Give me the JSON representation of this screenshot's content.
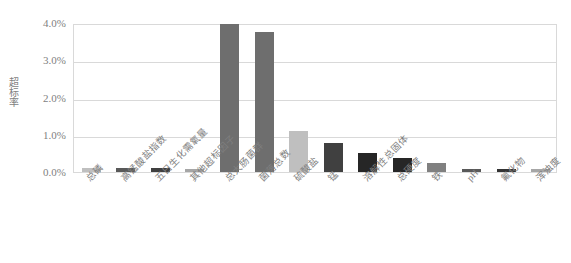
{
  "chart_data": {
    "type": "bar",
    "title": "",
    "subtitle": "",
    "xlabel": "",
    "ylabel": "超标率",
    "ylim": [
      0,
      4.0
    ],
    "y_unit": "%",
    "grid": true,
    "legend": "none",
    "y_ticks": [
      "0.0%",
      "1.0%",
      "2.0%",
      "3.0%",
      "4.0%"
    ],
    "y_tick_values": [
      0.0,
      1.0,
      2.0,
      3.0,
      4.0
    ],
    "categories": [
      "总磷",
      "高锰酸盐指数",
      "五日生化需氧量",
      "其他超标因子",
      "总大肠菌群",
      "菌落总数",
      "硫酸盐",
      "锰",
      "溶解性总固体",
      "总硬度",
      "铁",
      "pH",
      "氟化物",
      "浑浊度"
    ],
    "values": [
      0.1,
      0.11,
      0.12,
      0.09,
      3.97,
      3.75,
      1.1,
      0.78,
      0.5,
      0.37,
      0.25,
      0.09,
      0.09,
      0.08
    ],
    "bar_colors": [
      "#bfbfbf",
      "#595959",
      "#404040",
      "#a6a6a6",
      "#6e6e6e",
      "#6e6e6e",
      "#bfbfbf",
      "#404040",
      "#262626",
      "#262626",
      "#808080",
      "#595959",
      "#333333",
      "#a6a6a6"
    ],
    "axis_color": "#d9d9d9",
    "text_color": "#7f7f7f",
    "plot_background": "#ffffff"
  },
  "labels": {
    "y_axis_title": "超标率"
  }
}
